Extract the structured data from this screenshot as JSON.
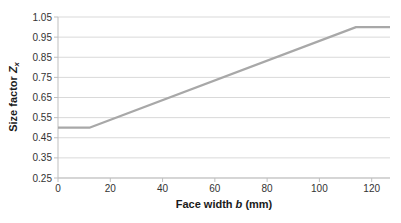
{
  "chart_data": {
    "type": "line",
    "title": "",
    "xlabel": "Face width b (mm)",
    "ylabel": "Size factor Zx",
    "xlabel_parts": [
      {
        "text": "Face width ",
        "italic": false,
        "subscript": false
      },
      {
        "text": "b",
        "italic": true,
        "subscript": false
      },
      {
        "text": " (mm)",
        "italic": false,
        "subscript": false
      }
    ],
    "ylabel_parts": [
      {
        "text": "Size factor ",
        "italic": false,
        "subscript": false
      },
      {
        "text": "Z",
        "italic": true,
        "subscript": false
      },
      {
        "text": "x",
        "italic": true,
        "subscript": true
      }
    ],
    "series": [
      {
        "name": "size-factor-curve",
        "color": "#a8a8a8",
        "points": [
          [
            0,
            0.5
          ],
          [
            12,
            0.5
          ],
          [
            114,
            1.0
          ],
          [
            127,
            1.0
          ]
        ]
      }
    ],
    "xlim": [
      0,
      127
    ],
    "ylim": [
      0.25,
      1.05
    ],
    "xticks": [
      0,
      20,
      40,
      60,
      80,
      100,
      120
    ],
    "yticks": [
      0.25,
      0.35,
      0.45,
      0.55,
      0.65,
      0.75,
      0.85,
      0.95,
      1.05
    ],
    "y_tick_decimals": 2,
    "grid": "horizontal",
    "legend": "none",
    "colors": {
      "background": "#ffffff",
      "gridline": "#d9d9d9",
      "axis": "#bfbfbf",
      "tick_label": "#333333",
      "title": "#1a1a1a"
    }
  }
}
